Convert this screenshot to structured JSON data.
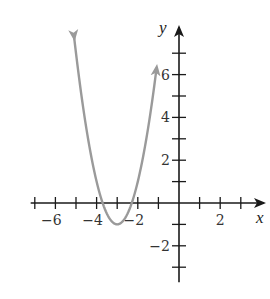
{
  "chart_data": {
    "type": "line",
    "title": "",
    "xlabel": "x",
    "ylabel": "y",
    "function": "y = 2(x + 3)^2 - 1",
    "vertex": [
      -3,
      -1
    ],
    "domain_shown": [
      -5.1,
      -1.1
    ],
    "xlim": [
      -7.2,
      4.1
    ],
    "ylim": [
      -3.7,
      8.3
    ],
    "x_ticks": [
      -7,
      -6,
      -5,
      -4,
      -3,
      -2,
      -1,
      1,
      2,
      3
    ],
    "x_tick_labels": [
      {
        "value": -6,
        "label": "−6"
      },
      {
        "value": -4,
        "label": "−4"
      },
      {
        "value": -2,
        "label": "−2"
      },
      {
        "value": 2,
        "label": "2"
      }
    ],
    "y_ticks": [
      -3,
      -2,
      -1,
      1,
      2,
      3,
      4,
      5,
      6,
      7
    ],
    "y_tick_labels": [
      {
        "value": 6,
        "label": "6"
      },
      {
        "value": 4,
        "label": "4"
      },
      {
        "value": 2,
        "label": "2"
      },
      {
        "value": -2,
        "label": "−2"
      }
    ],
    "grid": false,
    "curve_color": "#9a9a9a",
    "axis_color": "#1a1a1a",
    "series": [
      {
        "name": "parabola",
        "x": [
          -5.1,
          -5,
          -4.5,
          -4,
          -3.5,
          -3,
          -2.5,
          -2,
          -1.5,
          -1.1
        ],
        "y": [
          7.82,
          7,
          3.5,
          1,
          -0.5,
          -1,
          -0.5,
          1,
          3.5,
          6.22
        ]
      }
    ]
  },
  "labels": {
    "x_axis": "x",
    "y_axis": "y"
  }
}
